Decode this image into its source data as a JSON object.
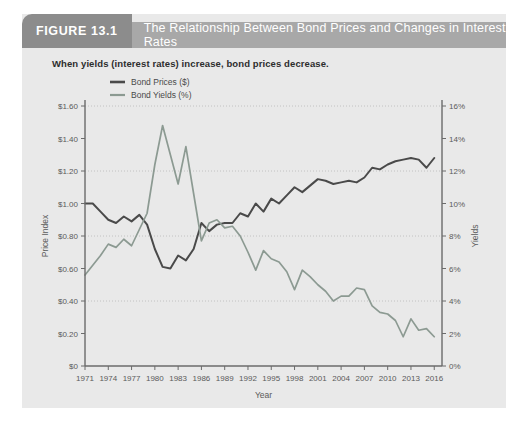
{
  "figure": {
    "number_label": "FIGURE 13.1",
    "title": "The Relationship Between Bond Prices and Changes in Interest Rates",
    "subtitle": "When yields (interest rates) increase, bond prices decrease."
  },
  "colors": {
    "panel_background": "#e9e9e9",
    "header_tab": "#8c8c8c",
    "header_bar": "#a8a8a8",
    "prices_line": "#4a4a4a",
    "yields_line": "#8c9a92",
    "axis": "#6b6b6b",
    "grid": "#b8b8b8"
  },
  "chart_data": {
    "type": "line",
    "title": "The Relationship Between Bond Prices and Changes in Interest Rates",
    "subtitle": "When yields (interest rates) increase, bond prices decrease.",
    "xlabel": "Year",
    "ylabel": "Price Index",
    "y2label": "Yields",
    "grid": true,
    "legend_position": "top-left",
    "xlim": [
      1971,
      2017
    ],
    "ylim": [
      0,
      1.6
    ],
    "y2lim": [
      0,
      16
    ],
    "xticks": [
      1971,
      1974,
      1977,
      1980,
      1983,
      1986,
      1989,
      1992,
      1995,
      1998,
      2001,
      2004,
      2007,
      2010,
      2013,
      2016
    ],
    "xticklabels": [
      "1971",
      "1974",
      "1977",
      "1980",
      "1983",
      "1986",
      "1989",
      "1992",
      "1995",
      "1998",
      "2001",
      "2004",
      "2007",
      "2010",
      "2013",
      "2016"
    ],
    "yticks": [
      0,
      0.2,
      0.4,
      0.6,
      0.8,
      1.0,
      1.2,
      1.4,
      1.6
    ],
    "yticklabels": [
      "$0",
      "$0.20",
      "$0.40",
      "$0.60",
      "$0.80",
      "$1.00",
      "$1.20",
      "$1.40",
      "$1.60"
    ],
    "y2ticks": [
      0,
      2,
      4,
      6,
      8,
      10,
      12,
      14,
      16
    ],
    "y2ticklabels": [
      "0%",
      "2%",
      "4%",
      "6%",
      "8%",
      "10%",
      "12%",
      "14%",
      "16%"
    ],
    "gridlines_y": [
      0.4,
      0.8,
      1.2,
      1.6
    ],
    "series": [
      {
        "name": "Bond Prices ($)",
        "axis": "left",
        "color": "#4a4a4a",
        "legend_label": "Bond Prices ($)",
        "x": [
          1971,
          1972,
          1973,
          1974,
          1975,
          1976,
          1977,
          1978,
          1979,
          1980,
          1981,
          1982,
          1983,
          1984,
          1985,
          1986,
          1987,
          1988,
          1989,
          1990,
          1991,
          1992,
          1993,
          1994,
          1995,
          1996,
          1997,
          1998,
          1999,
          2000,
          2001,
          2002,
          2003,
          2004,
          2005,
          2006,
          2007,
          2008,
          2009,
          2010,
          2011,
          2012,
          2013,
          2014,
          2015,
          2016
        ],
        "y": [
          1.0,
          1.0,
          0.95,
          0.9,
          0.88,
          0.92,
          0.89,
          0.93,
          0.87,
          0.72,
          0.61,
          0.6,
          0.68,
          0.65,
          0.72,
          0.88,
          0.83,
          0.87,
          0.88,
          0.88,
          0.94,
          0.92,
          1.0,
          0.95,
          1.03,
          1.0,
          1.05,
          1.1,
          1.07,
          1.11,
          1.15,
          1.14,
          1.12,
          1.13,
          1.14,
          1.13,
          1.16,
          1.22,
          1.21,
          1.24,
          1.26,
          1.27,
          1.28,
          1.27,
          1.22,
          1.28
        ]
      },
      {
        "name": "Bond Yields (%)",
        "axis": "right",
        "color": "#8c9a92",
        "legend_label": "Bond Yields (%)",
        "x": [
          1971,
          1972,
          1973,
          1974,
          1975,
          1976,
          1977,
          1978,
          1979,
          1980,
          1981,
          1982,
          1983,
          1984,
          1985,
          1986,
          1987,
          1988,
          1989,
          1990,
          1991,
          1992,
          1993,
          1994,
          1995,
          1996,
          1997,
          1998,
          1999,
          2000,
          2001,
          2002,
          2003,
          2004,
          2005,
          2006,
          2007,
          2008,
          2009,
          2010,
          2011,
          2012,
          2013,
          2014,
          2015,
          2016
        ],
        "y": [
          5.6,
          6.2,
          6.8,
          7.5,
          7.3,
          7.8,
          7.4,
          8.4,
          9.4,
          12.4,
          14.8,
          13.0,
          11.2,
          13.5,
          10.6,
          7.7,
          8.8,
          9.0,
          8.5,
          8.6,
          8.0,
          7.0,
          5.9,
          7.1,
          6.6,
          6.4,
          5.8,
          4.7,
          5.9,
          5.5,
          5.0,
          4.6,
          4.0,
          4.3,
          4.3,
          4.8,
          4.7,
          3.7,
          3.3,
          3.2,
          2.8,
          1.8,
          2.9,
          2.2,
          2.3,
          1.8
        ]
      }
    ],
    "annotations": []
  }
}
